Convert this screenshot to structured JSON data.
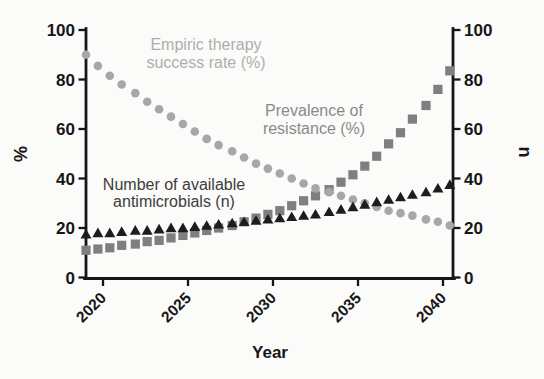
{
  "figure": {
    "background": "#fbfbf9",
    "axis_color": "#161616"
  },
  "chart_data": {
    "type": "scatter",
    "title": "",
    "xlabel": "Year",
    "ylabel_left": "%",
    "ylabel_right": "n",
    "grid": false,
    "legend_position": "inline-annotations",
    "xlim": [
      2019,
      2041
    ],
    "ylim_left": [
      0,
      100
    ],
    "ylim_right": [
      0,
      100
    ],
    "x_ticks": [
      2020,
      2025,
      2030,
      2035,
      2040
    ],
    "y_ticks": [
      0,
      20,
      40,
      60,
      80,
      100
    ],
    "n_points": 31,
    "x": [
      2019.0,
      2019.7,
      2020.4,
      2021.1,
      2021.9,
      2022.6,
      2023.3,
      2024.0,
      2024.7,
      2025.4,
      2026.1,
      2026.8,
      2027.6,
      2028.3,
      2029.0,
      2029.7,
      2030.4,
      2031.1,
      2031.8,
      2032.5,
      2033.3,
      2034.0,
      2034.7,
      2035.4,
      2036.1,
      2036.8,
      2037.5,
      2038.2,
      2039.0,
      2039.7,
      2040.4
    ],
    "series": [
      {
        "name": "Empiric therapy success rate (%)",
        "label_line1": "Empiric therapy",
        "label_line2": "success rate (%)",
        "marker": "circle",
        "color": "#a7a7a7",
        "label_color": "#aeaeae",
        "axis": "left",
        "values": [
          90,
          85.5,
          81.5,
          78,
          74.5,
          71,
          68,
          65,
          62,
          59,
          56,
          53.5,
          51,
          48.5,
          46,
          44,
          42,
          40,
          38,
          36,
          34.5,
          33,
          31.5,
          30,
          28.5,
          27,
          26,
          25,
          23.5,
          22.5,
          21
        ]
      },
      {
        "name": "Prevalence of resistance (%)",
        "label_line1": "Prevalence of",
        "label_line2": "resistance (%)",
        "marker": "square",
        "color": "#7f7f7f",
        "label_color": "#8a8a8a",
        "axis": "left",
        "values": [
          11,
          11.5,
          12,
          13,
          13.5,
          14.5,
          15,
          16,
          17,
          18,
          19,
          20,
          21,
          22.5,
          24,
          25.5,
          27,
          29,
          31,
          33,
          35.5,
          38.5,
          41.5,
          45,
          49,
          54,
          58.5,
          64,
          69.5,
          76,
          83.5
        ]
      },
      {
        "name": "Number of available antimicrobials (n)",
        "label_line1": "Number of available",
        "label_line2": "antimicrobials (n)",
        "marker": "triangle",
        "color": "#1d1d1d",
        "label_color": "#3d3d3d",
        "axis": "right",
        "values": [
          17.5,
          18,
          18,
          18.5,
          19,
          19,
          19.5,
          20,
          20,
          20.5,
          21,
          21.5,
          22,
          22.5,
          23,
          23.5,
          24,
          24.5,
          25,
          25.5,
          26.5,
          27.5,
          28.5,
          29.5,
          30.5,
          31.5,
          32.5,
          33.5,
          34.5,
          36,
          37.5
        ]
      }
    ]
  }
}
